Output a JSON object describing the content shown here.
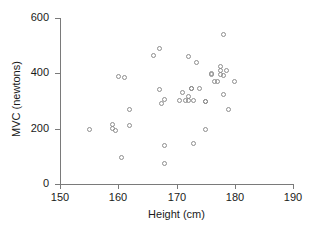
{
  "chart_data": {
    "type": "scatter",
    "title": "",
    "xlabel": "Height (cm)",
    "ylabel": "MVC (newtons)",
    "xlim": [
      150,
      190
    ],
    "ylim": [
      0,
      600
    ],
    "xticks": [
      150,
      160,
      170,
      180,
      190
    ],
    "yticks": [
      0,
      200,
      400,
      600
    ],
    "grid": false,
    "legend": null,
    "marker": "open-circle",
    "marker_color": "#8e8e8e",
    "x": [
      155,
      159,
      159,
      159.5,
      160,
      160.5,
      161,
      162,
      162,
      166,
      167,
      167,
      167.5,
      168,
      168,
      168,
      170.5,
      171,
      171.5,
      172,
      172,
      172,
      172.5,
      172.5,
      173,
      173,
      173.5,
      174,
      175,
      175,
      175,
      176,
      176,
      176.5,
      177,
      177.5,
      177.5,
      177.5,
      178,
      178,
      178,
      178.5,
      179,
      180
    ],
    "y": [
      196,
      216,
      199,
      193,
      390,
      97,
      386,
      269,
      213,
      465,
      490,
      340,
      291,
      304,
      138,
      75,
      302,
      330,
      303,
      462,
      317,
      301,
      345,
      345,
      301,
      147,
      440,
      345,
      300,
      300,
      196,
      398,
      396,
      370,
      370,
      424,
      412,
      394,
      540,
      392,
      322,
      412,
      268,
      369
    ],
    "n_points": 44
  },
  "axes": {
    "x_tick_labels": [
      "150",
      "160",
      "170",
      "180",
      "190"
    ],
    "y_tick_labels": [
      "0",
      "200",
      "400",
      "600"
    ]
  }
}
